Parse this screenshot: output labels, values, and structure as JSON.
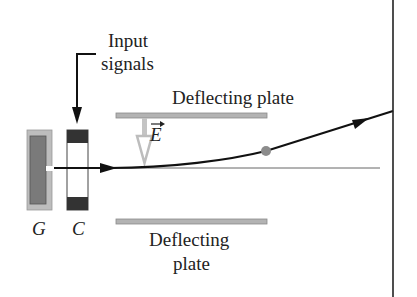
{
  "labels": {
    "input_line1": "Input",
    "input_line2": "signals",
    "top_plate": "Deflecting plate",
    "bottom_plate_line1": "Deflecting",
    "bottom_plate_line2": "plate",
    "field": "E",
    "gun": "G",
    "control": "C"
  },
  "colors": {
    "plate": "#b3b3b3",
    "gun_outer": "#bdbdbd",
    "gun_inner": "#7a7a7a",
    "control_dark": "#333333",
    "beam": "#111111",
    "dot": "#8c8c8c",
    "axis": "#666666"
  }
}
